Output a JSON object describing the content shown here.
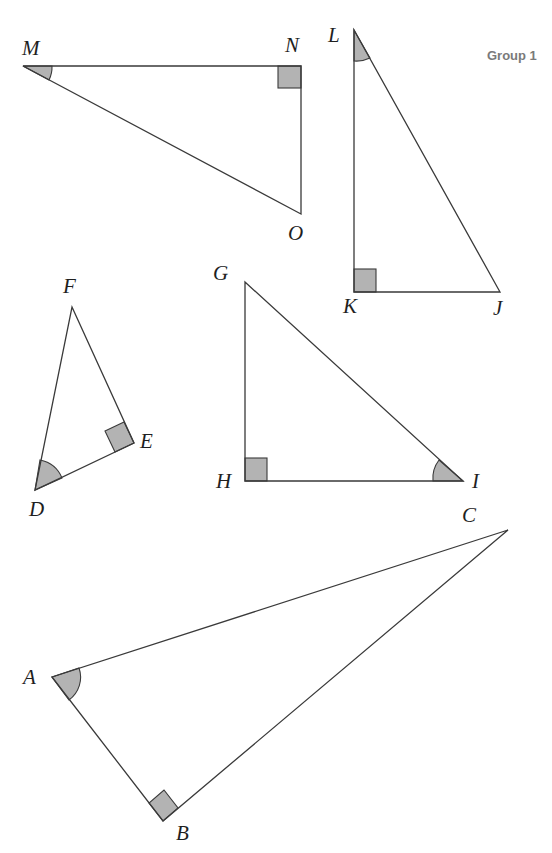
{
  "page": {
    "group_label": "Group 1"
  },
  "style": {
    "line_color": "#3a3a3a",
    "marker_fill": "#b3b3b3",
    "label_color": "#1f1f1f",
    "group_label_color": "#7a7a7a"
  },
  "triangles": [
    {
      "name": "MNO",
      "vertices": {
        "M": [
          23,
          66
        ],
        "N": [
          301,
          66
        ],
        "O": [
          301,
          214
        ]
      },
      "right_angle_at": "N",
      "marked_angle_at": "M",
      "labels": {
        "M": "M",
        "N": "N",
        "O": "O"
      }
    },
    {
      "name": "LKJ",
      "vertices": {
        "L": [
          354,
          30
        ],
        "K": [
          354,
          292
        ],
        "J": [
          500,
          292
        ]
      },
      "right_angle_at": "K",
      "marked_angle_at": "L",
      "labels": {
        "L": "L",
        "K": "K",
        "J": "J"
      }
    },
    {
      "name": "DEF",
      "vertices": {
        "F": [
          72,
          307
        ],
        "E": [
          134,
          443
        ],
        "D": [
          35,
          490
        ]
      },
      "right_angle_at": "E",
      "marked_angle_at": "D",
      "labels": {
        "F": "F",
        "E": "E",
        "D": "D"
      }
    },
    {
      "name": "GHI",
      "vertices": {
        "G": [
          245,
          282
        ],
        "H": [
          245,
          481
        ],
        "I": [
          463,
          481
        ]
      },
      "right_angle_at": "H",
      "marked_angle_at": "I",
      "labels": {
        "G": "G",
        "H": "H",
        "I": "I"
      }
    },
    {
      "name": "ABC",
      "vertices": {
        "A": [
          52,
          677
        ],
        "B": [
          163,
          821
        ],
        "C": [
          508,
          530
        ]
      },
      "right_angle_at": "B",
      "marked_angle_at": "A",
      "labels": {
        "A": "A",
        "B": "B",
        "C": "C"
      }
    }
  ]
}
